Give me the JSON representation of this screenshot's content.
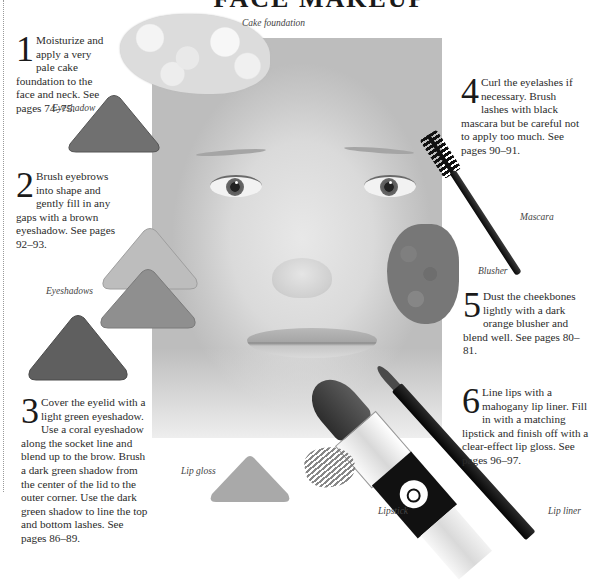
{
  "page": {
    "title": "FACE MAKEUP",
    "colors": {
      "background": "#ffffff",
      "text": "#2b2b2b",
      "eyeshadow_brown": "#6e6e6e",
      "eyeshadow_light_green": "#b9b9b9",
      "eyeshadow_coral": "#8e8e8e",
      "eyeshadow_dark_green": "#5f5f5f",
      "lip_gloss": "#a8a8a8"
    }
  },
  "captions": {
    "cake_foundation": "Cake foundation",
    "eyeshadow": "Eyeshadow",
    "eyeshadows": "Eyeshadows",
    "mascara": "Mascara",
    "blusher": "Blusher",
    "lip_gloss": "Lip gloss",
    "lipstick": "Lipstick",
    "lip_liner": "Lip liner"
  },
  "steps": [
    {
      "number": "1",
      "text": "Moisturize and apply a very pale cake foundation to the face and neck. See pages 74–75."
    },
    {
      "number": "2",
      "text": "Brush eyebrows into shape and gently fill in any gaps with a brown eyeshadow. See pages 92–93."
    },
    {
      "number": "3",
      "text": "Cover the eyelid with a light green eyeshadow. Use a coral eyeshadow along the socket line and blend up to the brow. Brush a dark green shadow from the center of the lid to the outer corner. Use the dark green shadow to line the top and bottom lashes. See pages 86–89."
    },
    {
      "number": "4",
      "text": "Curl the eyelashes if necessary. Brush lashes with black mascara but be careful not to apply too much. See pages 90–91."
    },
    {
      "number": "5",
      "text": "Dust the cheekbones lightly with a dark orange blusher and blend well. See pages 80–81."
    },
    {
      "number": "6",
      "text": "Line lips with a mahogany lip liner. Fill in with a matching lipstick and finish off with a clear-effect lip gloss. See pages 96–97."
    }
  ]
}
